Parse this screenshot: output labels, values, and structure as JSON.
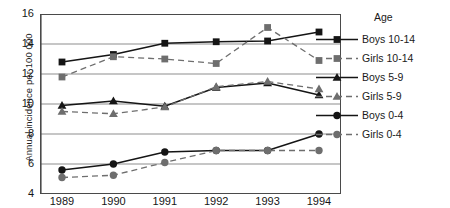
{
  "chart_data": {
    "type": "line",
    "title": "",
    "xlabel": "",
    "ylabel": "Annual incidence per 100 000",
    "categories": [
      "1989",
      "1990",
      "1991",
      "1992",
      "1993",
      "1994"
    ],
    "ylim": [
      4,
      16
    ],
    "yticks": [
      16,
      14,
      12,
      10,
      8,
      6,
      4
    ],
    "grid": true,
    "legend_position": "right",
    "legend_title": "Age",
    "series": [
      {
        "name": "Boys 10-14",
        "marker": "square",
        "line": "solid",
        "color": "#151515",
        "values": [
          12.8,
          13.3,
          14.05,
          14.15,
          14.2,
          14.8
        ]
      },
      {
        "name": "Girls 10-14",
        "marker": "square",
        "line": "dashed",
        "color": "#6e6e6e",
        "values": [
          11.8,
          13.15,
          13.0,
          12.7,
          15.1,
          12.9
        ]
      },
      {
        "name": "Boys 5-9",
        "marker": "triangle",
        "line": "solid",
        "color": "#151515",
        "values": [
          9.9,
          10.2,
          9.85,
          11.1,
          11.4,
          10.6
        ]
      },
      {
        "name": "Girls 5-9",
        "marker": "triangle",
        "line": "dashed",
        "color": "#6e6e6e",
        "values": [
          9.5,
          9.35,
          9.8,
          11.15,
          11.5,
          11.0
        ]
      },
      {
        "name": "Boys 0-4",
        "marker": "circle",
        "line": "solid",
        "color": "#151515",
        "values": [
          5.6,
          6.0,
          6.8,
          6.9,
          6.9,
          8.0
        ]
      },
      {
        "name": "Girls 0-4",
        "marker": "circle",
        "line": "dashed",
        "color": "#6e6e6e",
        "values": [
          5.1,
          5.25,
          6.1,
          6.9,
          6.9,
          6.9
        ]
      }
    ]
  }
}
